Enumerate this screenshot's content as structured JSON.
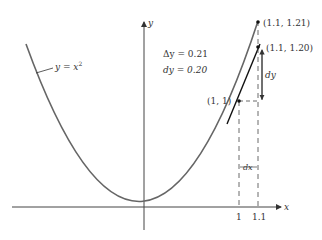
{
  "diagram": {
    "curve_label": "y = x²",
    "curve_label_parts": {
      "lhs": "y",
      "eq": " = ",
      "var": "x",
      "exp": "2"
    },
    "axes": {
      "x_label": "x",
      "y_label": "y"
    },
    "x_ticks": [
      "1",
      "1.1"
    ],
    "annotations": {
      "delta_y": "Δy = 0.21",
      "dy": "dy = 0.20",
      "dy_arrow_label": "dy",
      "dx_label": "dx"
    },
    "points": [
      {
        "label": "(1, 1)",
        "x": 1,
        "y": 1
      },
      {
        "label": "(1.1, 1.21)",
        "x": 1.1,
        "y": 1.21
      },
      {
        "label": "(1.1, 1.20)",
        "x": 1.1,
        "y": 1.2
      }
    ],
    "colors": {
      "curve": "#666666",
      "tangent": "#111111",
      "axes": "#444444"
    }
  }
}
